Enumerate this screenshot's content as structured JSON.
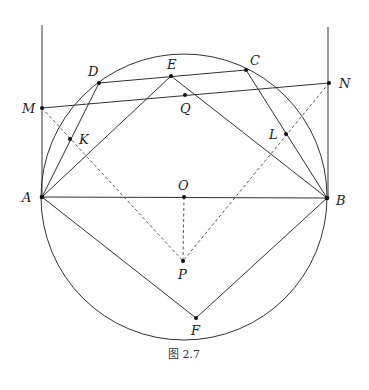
{
  "figure": {
    "caption": "图 2.7",
    "circle": {
      "center": "O",
      "cx": 184,
      "cy": 197,
      "r": 143
    },
    "points": [
      {
        "name": "A",
        "x": 42,
        "y": 197
      },
      {
        "name": "B",
        "x": 327,
        "y": 198
      },
      {
        "name": "O",
        "x": 184,
        "y": 197
      },
      {
        "name": "P",
        "x": 183,
        "y": 261
      },
      {
        "name": "F",
        "x": 196,
        "y": 318
      },
      {
        "name": "D",
        "x": 99,
        "y": 83
      },
      {
        "name": "E",
        "x": 171,
        "y": 76
      },
      {
        "name": "C",
        "x": 246,
        "y": 70
      },
      {
        "name": "M",
        "x": 42,
        "y": 108
      },
      {
        "name": "N",
        "x": 329,
        "y": 83
      },
      {
        "name": "Q",
        "x": 185,
        "y": 95
      },
      {
        "name": "K",
        "x": 70,
        "y": 139
      },
      {
        "name": "L",
        "x": 286,
        "y": 134
      }
    ],
    "labels": {
      "A": "A",
      "B": "B",
      "O": "O",
      "P": "P",
      "F": "F",
      "D": "D",
      "E": "E",
      "C": "C",
      "M": "M",
      "N": "N",
      "Q": "Q",
      "K": "K",
      "L": "L"
    },
    "solid_segments": [
      [
        "A",
        "B"
      ],
      [
        "A",
        "E"
      ],
      [
        "E",
        "B"
      ],
      [
        "A",
        "F"
      ],
      [
        "F",
        "B"
      ],
      [
        "A",
        "D"
      ],
      [
        "D",
        "C"
      ],
      [
        "C",
        "B"
      ],
      [
        "M",
        "N"
      ]
    ],
    "dashed_segments": [
      [
        "M",
        "P"
      ],
      [
        "N",
        "P"
      ],
      [
        "O",
        "P"
      ]
    ],
    "vertical_lines": [
      {
        "x": 42,
        "y1": 25,
        "y2": 197
      },
      {
        "x": 328,
        "y1": 27,
        "y2": 198
      }
    ]
  }
}
